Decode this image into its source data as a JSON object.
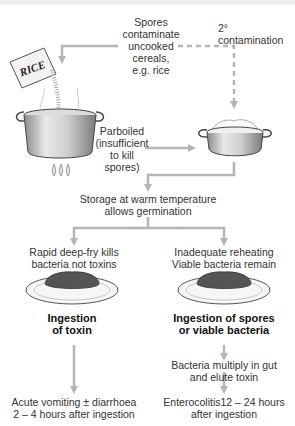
{
  "diagram": {
    "top_bar_color": "#ececec",
    "arrow_color": "#b5b5b5",
    "labels": {
      "spores_contaminate": [
        "Spores",
        "contaminate",
        "uncooked",
        "cereals,",
        "e.g. rice"
      ],
      "secondary_contamination": [
        "2°",
        "contamination"
      ],
      "rice_bag": "RICE",
      "parboiled": [
        "Parboiled",
        "(insufficient",
        "to kill",
        "spores)"
      ],
      "storage": [
        "Storage at warm temperature",
        "allows germination"
      ],
      "left_branch": [
        "Rapid deep-fry kills",
        "bacteria not toxins"
      ],
      "right_branch": [
        "Inadequate reheating",
        "Viable bacteria remain"
      ],
      "left_ingestion": [
        "Ingestion",
        "of toxin"
      ],
      "right_ingestion": [
        "Ingestion of spores",
        "or viable bacteria"
      ],
      "bacteria_multiply": [
        "Bacteria multiply in gut",
        "and elute toxin"
      ],
      "left_outcome": [
        "Acute vomiting ± diarrhoea",
        "2 – 4 hours after ingestion"
      ],
      "right_outcome": [
        "Enterocolitis12 – 24 hours",
        "after ingestion"
      ]
    },
    "icons": [
      "rice-bag-icon",
      "stock-pot-icon",
      "gas-flame-icon",
      "serving-pan-icon",
      "plate-of-rice-icon"
    ]
  }
}
